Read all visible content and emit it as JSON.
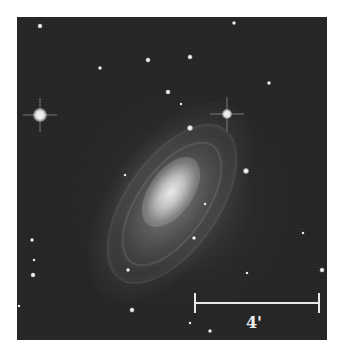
{
  "image": {
    "subject": "spiral galaxy",
    "background_color": "#262626",
    "scale_bar": {
      "label": "4'",
      "color": "#e8e8e8"
    }
  }
}
